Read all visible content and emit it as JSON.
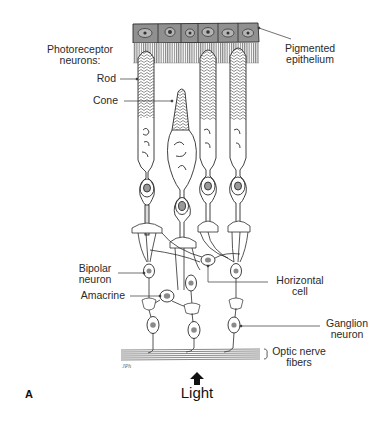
{
  "figure": {
    "panel_label": "A",
    "light_label": "Light",
    "colors": {
      "line": "#2b2b2b",
      "epithelium_fill": "#8f8f8f",
      "nucleus_fill": "#9a9a9a",
      "background": "#ffffff"
    }
  },
  "labels": {
    "photoreceptor_group": "Photoreceptor neurons:",
    "photoreceptor_line1": "Photoreceptor",
    "photoreceptor_line2": "neurons:",
    "rod": "Rod",
    "cone": "Cone",
    "pigmented_line1": "Pigmented",
    "pigmented_line2": "epithelium",
    "bipolar_line1": "Bipolar",
    "bipolar_line2": "neuron",
    "amacrine": "Amacrine",
    "horizontal_line1": "Horizontal",
    "horizontal_line2": "cell",
    "ganglion_line1": "Ganglion",
    "ganglion_line2": "neuron",
    "optic_line1": "Optic nerve",
    "optic_line2": "fibers"
  },
  "icons": {
    "light_arrow": "up-arrow-icon"
  }
}
